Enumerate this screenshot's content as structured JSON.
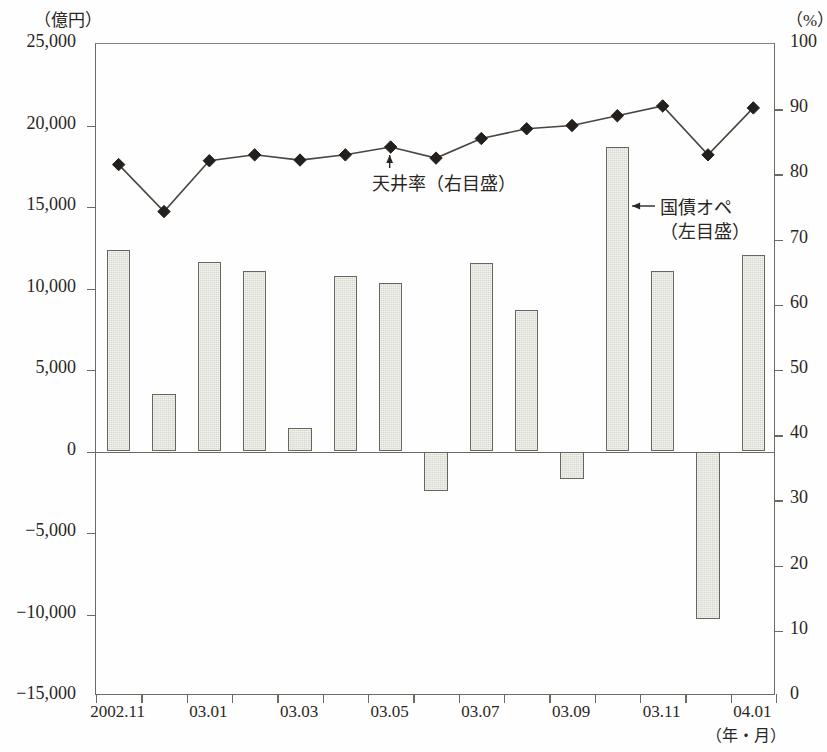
{
  "title": "",
  "axes": {
    "left_unit": "（億円）",
    "right_unit": "（%）",
    "x_unit": "（年・月）",
    "left_ticks": [
      "25,000",
      "20,000",
      "15,000",
      "10,000",
      "5,000",
      "0",
      "−5,000",
      "−10,000",
      "−15,000"
    ],
    "right_ticks": [
      "100",
      "90",
      "80",
      "70",
      "60",
      "50",
      "40",
      "30",
      "20",
      "10",
      "0"
    ],
    "x_ticks": [
      "2002.11",
      "03.01",
      "03.03",
      "03.05",
      "03.07",
      "03.09",
      "03.11",
      "04.01"
    ]
  },
  "annotations": {
    "ceiling": "天井率（右目盛）",
    "jgb_line1": "国債オペ",
    "jgb_line2": "（左目盛）"
  },
  "colors": {
    "bar_fill": "#d9d9d0",
    "bar_stroke": "#6a665e",
    "line_stroke": "#4a453e",
    "marker_fill": "#231f1c",
    "axis": "#6e6a62",
    "text": "#2a2622"
  },
  "chart_data": {
    "type": "bar",
    "title": "",
    "xlabel": "（年・月）",
    "ylabel": "（億円）",
    "y2label": "（%）",
    "ylim": [
      -15000,
      25000
    ],
    "y2lim": [
      0,
      100
    ],
    "grid": false,
    "legend": "in-plot annotations",
    "categories": [
      "2002.11",
      "2002.12",
      "03.01",
      "03.02",
      "03.03",
      "03.04",
      "03.05",
      "03.06",
      "03.07",
      "03.08",
      "03.09",
      "03.10",
      "03.11",
      "03.12",
      "04.01"
    ],
    "series": [
      {
        "name": "国債オペ（左目盛）",
        "type": "bar",
        "axis": "left",
        "unit": "億円",
        "values": [
          12350,
          3500,
          11600,
          11100,
          1450,
          10750,
          10350,
          -2450,
          11550,
          8700,
          -1700,
          18700,
          11050,
          -10300,
          12050
        ]
      },
      {
        "name": "天井率（右目盛）",
        "type": "line",
        "axis": "right",
        "unit": "%",
        "values": [
          81.5,
          74.3,
          82.1,
          83.0,
          82.2,
          83.0,
          84.2,
          82.5,
          85.5,
          87.0,
          87.5,
          89.0,
          90.5,
          83.0,
          90.2
        ]
      }
    ]
  }
}
